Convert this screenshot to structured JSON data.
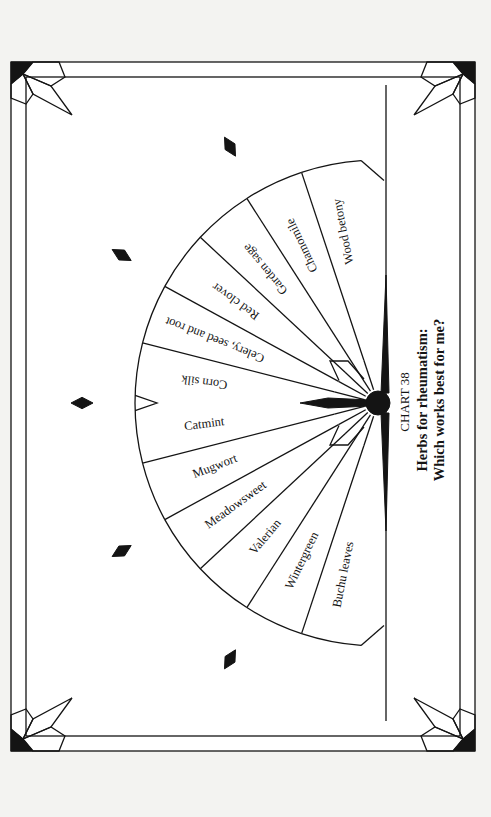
{
  "chart": {
    "number_label": "CHART 38",
    "title_line1": "Herbs for rheumatism:",
    "title_line2": "Which works best for me?"
  },
  "wheel": {
    "segments": [
      {
        "label": "Wood betony"
      },
      {
        "label": "Chamomile"
      },
      {
        "label": "Garden sage"
      },
      {
        "label": "Red clover"
      },
      {
        "label": "Celery, seed and root"
      },
      {
        "label": "Corn silk"
      },
      {
        "label": "Catmint"
      },
      {
        "label": "Mugwort"
      },
      {
        "label": "Meadowsweet"
      },
      {
        "label": "Valerian"
      },
      {
        "label": "Wintergreen"
      },
      {
        "label": "Buchu leaves"
      }
    ],
    "ring_marker_angles_deg": [
      -60,
      -30,
      0,
      30,
      60
    ]
  },
  "colors": {
    "ink": "#141414",
    "paper": "#ffffff",
    "background": "#f3f3f1"
  }
}
